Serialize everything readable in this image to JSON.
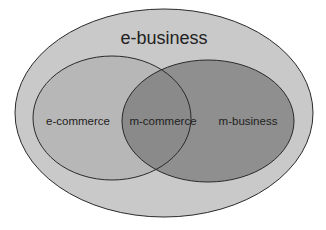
{
  "diagram": {
    "type": "venn",
    "outer_label": "e-business",
    "left_label": "e-commerce",
    "intersection_label": "m-commerce",
    "right_label": "m-business",
    "colors": {
      "outer_fill": "#c9c9c9",
      "left_fill": "#b5b5b5",
      "right_fill": "#8f8f8f",
      "intersection_fill": "#8a8a8a",
      "stroke": "#2a2a2a",
      "background": "#ffffff"
    }
  }
}
